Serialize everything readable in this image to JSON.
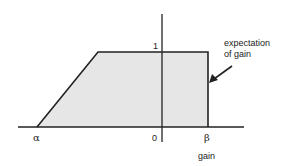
{
  "diagram": {
    "type": "membership-function",
    "shape": "trapezoid",
    "colors": {
      "fill": "#e6e6e6",
      "stroke": "#222222",
      "background": "#ffffff"
    },
    "axis_labels": {
      "y_top": "1",
      "x_left": "α",
      "x_origin": "0",
      "x_right": "β",
      "x_title": "gain"
    },
    "annotation": {
      "line1": "expectation",
      "line2": "of gain"
    }
  }
}
